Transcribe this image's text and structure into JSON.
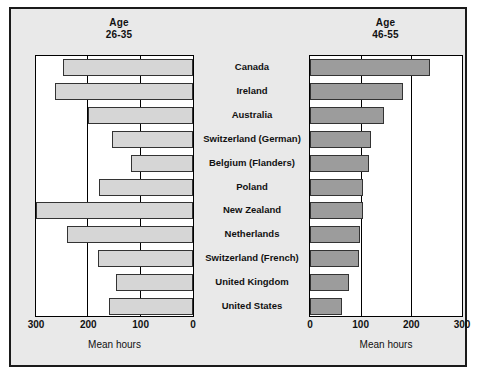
{
  "figure": {
    "left_panel_title_line1": "Age",
    "left_panel_title_line2": "26-35",
    "right_panel_title_line1": "Age",
    "right_panel_title_line2": "46-55",
    "left_axis_title": "Mean hours",
    "right_axis_title": "Mean hours",
    "left_bar_color": "#d6d6d6",
    "right_bar_color": "#9c9c9c",
    "background_color": "#e9e9e9",
    "plot_background_color": "#ffffff",
    "border_color": "#1a1a1a"
  },
  "chart_data": {
    "type": "bar",
    "title": "",
    "subtitle": "",
    "orientation": "horizontal",
    "layout": "butterfly-pyramid",
    "categories": [
      "Canada",
      "Ireland",
      "Australia",
      "Switzerland (German)",
      "Belgium (Flanders)",
      "Poland",
      "New Zealand",
      "Netherlands",
      "Switzerland (French)",
      "United Kingdom",
      "United States"
    ],
    "series": [
      {
        "name": "Age 26-35",
        "side": "left",
        "values": [
          248,
          264,
          200,
          154,
          118,
          180,
          300,
          241,
          182,
          148,
          160
        ]
      },
      {
        "name": "Age 46-55",
        "side": "right",
        "values": [
          237,
          184,
          147,
          121,
          116,
          104,
          104,
          99,
          96,
          77,
          63
        ]
      }
    ],
    "xlabel": "Mean hours",
    "ylabel": "",
    "xlim_left": [
      300,
      0
    ],
    "xlim_right": [
      0,
      300
    ],
    "left_ticks": [
      "300",
      "200",
      "100",
      "0"
    ],
    "right_ticks": [
      "0",
      "100",
      "200",
      "300"
    ],
    "grid": true,
    "legend": "none"
  }
}
